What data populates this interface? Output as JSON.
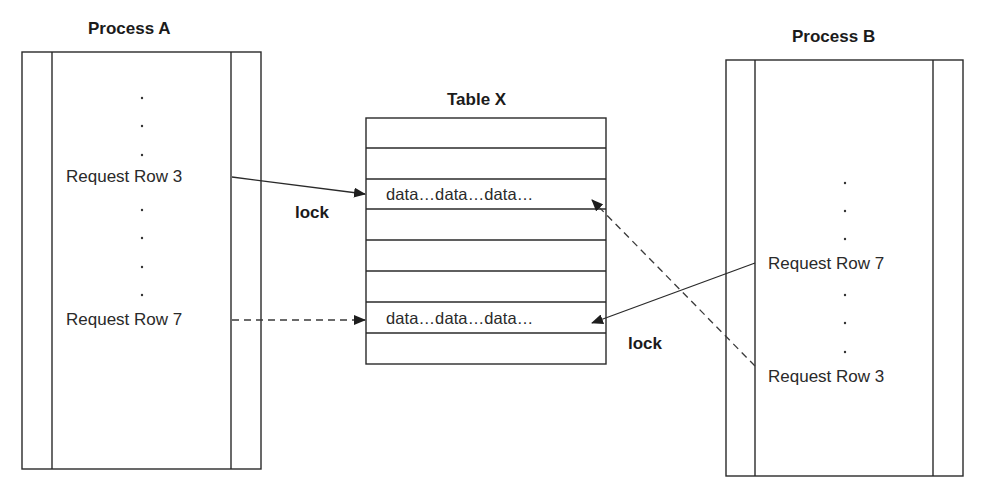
{
  "diagram": {
    "process_a": {
      "title": "Process A",
      "requests": [
        {
          "label": "Request Row 3",
          "target_row": 3,
          "line_style": "solid"
        },
        {
          "label": "Request Row 7",
          "target_row": 7,
          "line_style": "dashed"
        }
      ]
    },
    "table_x": {
      "title": "Table X",
      "row_count": 8,
      "rows": [
        {
          "index": 1,
          "content": ""
        },
        {
          "index": 2,
          "content": ""
        },
        {
          "index": 3,
          "content": "data…data…data…"
        },
        {
          "index": 4,
          "content": ""
        },
        {
          "index": 5,
          "content": ""
        },
        {
          "index": 6,
          "content": ""
        },
        {
          "index": 7,
          "content": "data…data…data…"
        },
        {
          "index": 8,
          "content": ""
        }
      ]
    },
    "process_b": {
      "title": "Process B",
      "requests": [
        {
          "label": "Request Row 7",
          "target_row": 7,
          "line_style": "solid"
        },
        {
          "label": "Request Row 3",
          "target_row": 3,
          "line_style": "dashed"
        }
      ]
    },
    "annotations": {
      "lock_a": "lock",
      "lock_b": "lock"
    },
    "ellipsis_dot": "."
  }
}
